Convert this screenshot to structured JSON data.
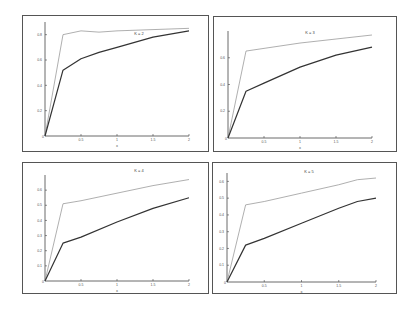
{
  "chart_data": [
    {
      "type": "line",
      "title": "K = 2",
      "xlabel": "x",
      "ylabel": "",
      "xlim": [
        0,
        2
      ],
      "ylim": [
        0,
        0.9
      ],
      "xticks": [
        "0.5",
        "1",
        "1.5",
        "2"
      ],
      "yticks": [
        "0.2",
        "0.4",
        "0.6",
        "0.8"
      ],
      "grid": false,
      "x": [
        0,
        0.25,
        0.5,
        0.75,
        1,
        1.5,
        2
      ],
      "series": [
        {
          "name": "upper",
          "color": "#9a9a9a",
          "values": [
            0,
            0.8,
            0.83,
            0.82,
            0.83,
            0.84,
            0.85
          ]
        },
        {
          "name": "lower",
          "color": "#333333",
          "values": [
            0,
            0.52,
            0.61,
            0.66,
            0.7,
            0.78,
            0.83
          ]
        }
      ]
    },
    {
      "type": "line",
      "title": "K = 3",
      "xlabel": "x",
      "ylabel": "",
      "xlim": [
        0,
        2
      ],
      "ylim": [
        0,
        0.8
      ],
      "xticks": [
        "0.5",
        "1",
        "1.5",
        "2"
      ],
      "yticks": [
        "0.2",
        "0.4",
        "0.6"
      ],
      "grid": false,
      "x": [
        0,
        0.25,
        0.5,
        1,
        1.5,
        2
      ],
      "series": [
        {
          "name": "upper",
          "color": "#9a9a9a",
          "values": [
            0,
            0.65,
            0.67,
            0.71,
            0.74,
            0.77
          ]
        },
        {
          "name": "lower",
          "color": "#333333",
          "values": [
            0,
            0.35,
            0.41,
            0.53,
            0.62,
            0.68
          ]
        }
      ]
    },
    {
      "type": "line",
      "title": "K = 4",
      "xlabel": "x",
      "ylabel": "",
      "xlim": [
        0,
        2
      ],
      "ylim": [
        0,
        0.7
      ],
      "xticks": [
        "0.5",
        "1",
        "1.5",
        "2"
      ],
      "yticks": [
        "0.1",
        "0.2",
        "0.3",
        "0.4",
        "0.5",
        "0.6"
      ],
      "grid": false,
      "x": [
        0,
        0.25,
        0.5,
        1,
        1.5,
        2
      ],
      "series": [
        {
          "name": "upper",
          "color": "#9a9a9a",
          "values": [
            0,
            0.51,
            0.53,
            0.58,
            0.63,
            0.67
          ]
        },
        {
          "name": "lower",
          "color": "#333333",
          "values": [
            0,
            0.25,
            0.29,
            0.39,
            0.48,
            0.55
          ]
        }
      ]
    },
    {
      "type": "line",
      "title": "K = 5",
      "xlabel": "x",
      "ylabel": "",
      "xlim": [
        0,
        2
      ],
      "ylim": [
        0,
        0.65
      ],
      "xticks": [
        "0.5",
        "1",
        "1.5",
        "2"
      ],
      "yticks": [
        "0.1",
        "0.2",
        "0.3",
        "0.4",
        "0.5",
        "0.6"
      ],
      "grid": false,
      "x": [
        0,
        0.25,
        0.5,
        1,
        1.5,
        1.75,
        2
      ],
      "series": [
        {
          "name": "upper",
          "color": "#9a9a9a",
          "values": [
            0,
            0.46,
            0.48,
            0.53,
            0.58,
            0.61,
            0.62
          ]
        },
        {
          "name": "lower",
          "color": "#333333",
          "values": [
            0,
            0.22,
            0.26,
            0.35,
            0.44,
            0.48,
            0.5
          ]
        }
      ]
    }
  ],
  "panels": [
    {
      "title": "K = 2"
    },
    {
      "title": "K = 3"
    },
    {
      "title": "K = 4"
    },
    {
      "title": "K = 5"
    }
  ]
}
